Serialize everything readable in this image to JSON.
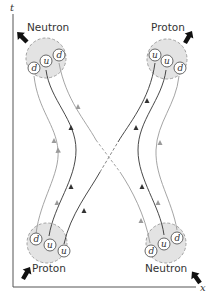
{
  "colors": {
    "nucleon_fill": "#e3e3e3",
    "nucleon_border": "#9a9a9a",
    "quark_line_dark": "#333333",
    "quark_line_light": "#9a9a9a",
    "axis": "#555555",
    "momentum_arrow": "#111111"
  },
  "axes": {
    "vertical_label": "t",
    "horizontal_label": "x"
  },
  "nucleons": [
    {
      "position": "top-left",
      "label": "Neutron",
      "quarks": [
        "d",
        "u",
        "d"
      ]
    },
    {
      "position": "top-right",
      "label": "Proton",
      "quarks": [
        "u",
        "u",
        "d"
      ]
    },
    {
      "position": "bottom-left",
      "label": "Proton",
      "quarks": [
        "d",
        "u",
        "u"
      ]
    },
    {
      "position": "bottom-right",
      "label": "Neutron",
      "quarks": [
        "d",
        "u",
        "d"
      ]
    }
  ],
  "momentum_arrows": [
    {
      "position": "top-left",
      "direction": "up-left",
      "icon": "bold-arrow-icon"
    },
    {
      "position": "top-right",
      "direction": "up-right",
      "icon": "bold-arrow-icon"
    },
    {
      "position": "bottom-left",
      "direction": "up-right",
      "icon": "bold-arrow-icon"
    },
    {
      "position": "bottom-right",
      "direction": "up-left",
      "icon": "bold-arrow-icon"
    }
  ],
  "exchange": {
    "description": "u and d quarks exchanged via crossing dashed lines",
    "style": "dashed crossing"
  }
}
